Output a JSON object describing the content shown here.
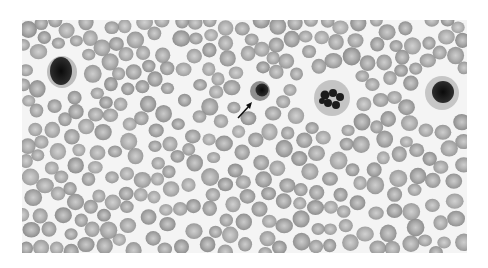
{
  "image": {
    "description": "Grayscale micrograph of a peripheral blood smear showing numerous red blood cells with central pallor, several white blood cells, and an arrow pointing to a nucleated red blood cell.",
    "colors": {
      "background": "#f4f4f4",
      "rbc_fill": "#9a9a9a",
      "rbc_pallor": "#c8c8c8",
      "nucleus": "#1a1a1a",
      "wbc_cytoplasm": "#b5b5b5",
      "arrow": "#111111"
    },
    "annotations": [
      {
        "type": "arrow",
        "label": "",
        "target": "nucleated-red-blood-cell"
      }
    ],
    "highlighted_cells": [
      {
        "name": "lymphocyte-left",
        "cx": 40,
        "cy": 52,
        "r": 13
      },
      {
        "name": "nucleated-rbc",
        "cx": 238,
        "cy": 71,
        "r": 9
      },
      {
        "name": "neutrophil-center",
        "cx": 310,
        "cy": 78,
        "r": 17
      },
      {
        "name": "lymphocyte-right",
        "cx": 420,
        "cy": 72,
        "r": 14
      }
    ]
  }
}
